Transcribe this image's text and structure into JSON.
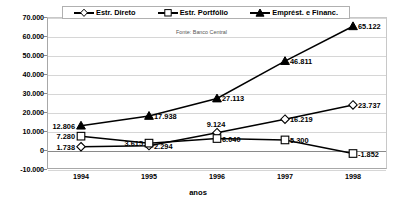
{
  "legend": {
    "items": [
      {
        "label": "Estr. Direto",
        "marker": "diamond-marker"
      },
      {
        "label": "Estr. Portfólio",
        "marker": "square-marker"
      },
      {
        "label": "Emprést. e Financ.",
        "marker": "triangle-marker"
      }
    ]
  },
  "source_note": "Fonte: Banco Central",
  "chart_data": {
    "type": "line",
    "title": "",
    "xlabel": "anos",
    "ylabel": "",
    "categories": [
      "1994",
      "1995",
      "1996",
      "1997",
      "1998"
    ],
    "ylim": [
      -10000,
      70000
    ],
    "ytick_values": [
      -10000,
      0,
      10000,
      20000,
      30000,
      40000,
      50000,
      60000,
      70000
    ],
    "ytick_labels": [
      "-10.000",
      "0",
      "10.000",
      "20.000",
      "30.000",
      "40.000",
      "50.000",
      "60.000",
      "70.000"
    ],
    "grid": true,
    "legend_position": "top",
    "series": [
      {
        "name": "Estr. Direto",
        "marker": "diamond",
        "values": [
          1738,
          2294,
          9124,
          16219,
          23737
        ],
        "labels": [
          "1.738",
          "2.294",
          "9.124",
          "16.219",
          "23.737"
        ]
      },
      {
        "name": "Estr. Portfólio",
        "marker": "square",
        "values": [
          7280,
          3615,
          6040,
          5300,
          -1852
        ],
        "labels": [
          "7.280",
          "3.615",
          "6.040",
          "5.300",
          "-1.852"
        ]
      },
      {
        "name": "Emprést. e Financ.",
        "marker": "triangle",
        "values": [
          12806,
          17938,
          27113,
          46811,
          65122
        ],
        "labels": [
          "12.806",
          "17.938",
          "27.113",
          "46.811",
          "65.122"
        ]
      }
    ]
  }
}
